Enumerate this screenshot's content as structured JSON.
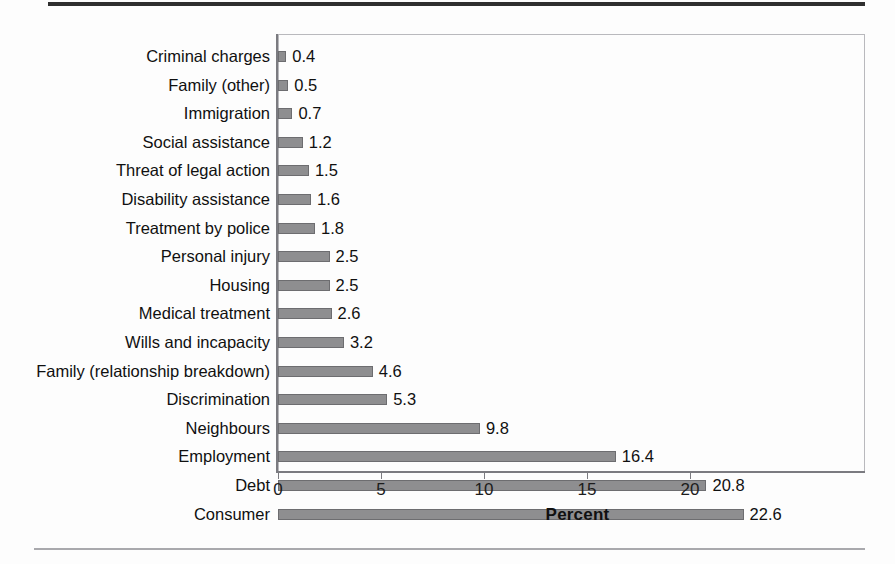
{
  "chart_data": {
    "type": "bar",
    "orientation": "horizontal",
    "title": "",
    "subtitle": "",
    "xlabel": "Percent",
    "ylabel": "",
    "categories": [
      "Criminal charges",
      "Family (other)",
      "Immigration",
      "Social assistance",
      "Threat of legal action",
      "Disability assistance",
      "Treatment by police",
      "Personal injury",
      "Housing",
      "Medical treatment",
      "Wills and incapacity",
      "Family (relationship breakdown)",
      "Discrimination",
      "Neighbours",
      "Employment",
      "Debt",
      "Consumer"
    ],
    "values": [
      0.4,
      0.5,
      0.7,
      1.2,
      1.5,
      1.6,
      1.8,
      2.5,
      2.5,
      2.6,
      3.2,
      4.6,
      5.3,
      9.8,
      16.4,
      20.8,
      22.6
    ],
    "value_labels": [
      "0.4",
      "0.5",
      "0.7",
      "1.2",
      "1.5",
      "1.6",
      "1.8",
      "2.5",
      "2.5",
      "2.6",
      "3.2",
      "4.6",
      "5.3",
      "9.8",
      "16.4",
      "20.8",
      "22.6"
    ],
    "xlim": [
      0,
      22.6
    ],
    "axis_max": 22.6,
    "xticks": [
      0,
      5,
      10,
      15,
      20
    ],
    "xtick_labels": [
      "0",
      "5",
      "10",
      "15",
      "20"
    ],
    "grid": false,
    "legend": null,
    "bar_color": "#8e8e90",
    "bar_border_color": "#6d6d70",
    "axis_color": "#7b7b80",
    "text_color": "#101010"
  }
}
